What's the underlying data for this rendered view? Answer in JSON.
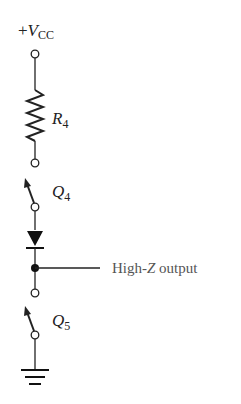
{
  "diagram": {
    "supply": {
      "prefix": "+",
      "symbol": "V",
      "subscript": "CC"
    },
    "resistor": {
      "symbol": "R",
      "subscript": "4"
    },
    "transistor_top": {
      "symbol": "Q",
      "subscript": "4"
    },
    "transistor_bottom": {
      "symbol": "Q",
      "subscript": "5"
    },
    "output": {
      "text_before": "High-",
      "italic": "Z",
      "text_after": " output"
    },
    "colors": {
      "wire": "#222222",
      "output_text": "#555555"
    }
  }
}
